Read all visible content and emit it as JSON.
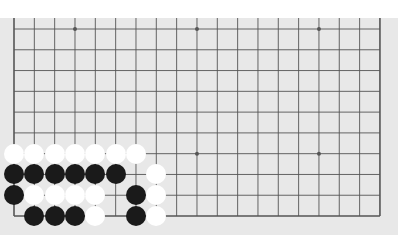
{
  "board": {
    "size": 19,
    "visible_rows": 10,
    "visible_cols": 19,
    "first_visible_row": 9,
    "origin_x": 14,
    "origin_y": 11,
    "spacing_x": 20.33,
    "spacing_y": 20.78,
    "colors": {
      "background": "#e8e8e8",
      "line": "#555555",
      "black_stone": "#1a1a1a",
      "white_stone": "#ffffff"
    },
    "star_points": [
      [
        3,
        0
      ],
      [
        9,
        0
      ],
      [
        15,
        0
      ],
      [
        3,
        6
      ],
      [
        9,
        6
      ],
      [
        15,
        6
      ]
    ],
    "stones": [
      {
        "color": "white",
        "col": 0,
        "row": 6
      },
      {
        "color": "white",
        "col": 1,
        "row": 6
      },
      {
        "color": "white",
        "col": 2,
        "row": 6
      },
      {
        "color": "white",
        "col": 3,
        "row": 6
      },
      {
        "color": "white",
        "col": 4,
        "row": 6
      },
      {
        "color": "white",
        "col": 5,
        "row": 6
      },
      {
        "color": "white",
        "col": 6,
        "row": 6
      },
      {
        "color": "black",
        "col": 0,
        "row": 7
      },
      {
        "color": "black",
        "col": 1,
        "row": 7
      },
      {
        "color": "black",
        "col": 2,
        "row": 7
      },
      {
        "color": "black",
        "col": 3,
        "row": 7
      },
      {
        "color": "black",
        "col": 4,
        "row": 7
      },
      {
        "color": "black",
        "col": 5,
        "row": 7
      },
      {
        "color": "white",
        "col": 7,
        "row": 7
      },
      {
        "color": "black",
        "col": 0,
        "row": 8
      },
      {
        "color": "white",
        "col": 1,
        "row": 8
      },
      {
        "color": "white",
        "col": 2,
        "row": 8
      },
      {
        "color": "white",
        "col": 3,
        "row": 8
      },
      {
        "color": "white",
        "col": 4,
        "row": 8
      },
      {
        "color": "black",
        "col": 6,
        "row": 8
      },
      {
        "color": "white",
        "col": 7,
        "row": 8
      },
      {
        "color": "black",
        "col": 1,
        "row": 9
      },
      {
        "color": "black",
        "col": 2,
        "row": 9
      },
      {
        "color": "black",
        "col": 3,
        "row": 9
      },
      {
        "color": "white",
        "col": 4,
        "row": 9
      },
      {
        "color": "black",
        "col": 6,
        "row": 9
      },
      {
        "color": "white",
        "col": 7,
        "row": 9
      }
    ]
  }
}
